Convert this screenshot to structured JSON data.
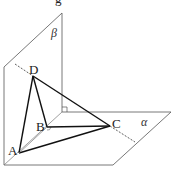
{
  "figure": {
    "planes": [
      {
        "id": "beta",
        "label": "β",
        "points": [
          [
            4,
            67
          ],
          [
            62,
            13
          ],
          [
            62,
            112
          ],
          [
            4,
            165
          ]
        ]
      },
      {
        "id": "alpha",
        "label": "α",
        "points": [
          [
            4,
            165
          ],
          [
            62,
            112
          ],
          [
            171,
            112
          ],
          [
            113,
            165
          ]
        ]
      }
    ],
    "points": {
      "A": {
        "label": "A",
        "x": 19,
        "y": 153
      },
      "B": {
        "label": "B",
        "x": 47,
        "y": 127
      },
      "C": {
        "label": "C",
        "x": 110,
        "y": 126
      },
      "D": {
        "label": "D",
        "x": 33,
        "y": 76
      }
    },
    "edges": [
      [
        "A",
        "B"
      ],
      [
        "A",
        "C"
      ],
      [
        "A",
        "D"
      ],
      [
        "B",
        "C"
      ],
      [
        "B",
        "D"
      ],
      [
        "C",
        "D"
      ]
    ],
    "dashed_line": {
      "from": [
        15,
        64
      ],
      "to": [
        135,
        142
      ]
    },
    "right_angle_marks": [
      "plane-intersection",
      "B"
    ],
    "top_partial_glyph": "g"
  },
  "labels": {
    "beta": "β",
    "alpha": "α",
    "A": "A",
    "B": "B",
    "C": "C",
    "D": "D",
    "top": "g"
  }
}
